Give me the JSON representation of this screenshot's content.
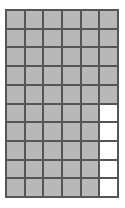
{
  "figure": {
    "name": "area-model-grid",
    "colors": {
      "shaded_fill": "#b8b8b8",
      "unshaded_fill": "#ffffff",
      "grid_line": "#555555",
      "background": "#ffffff"
    }
  },
  "chart_data": {
    "type": "heatmap",
    "title": "",
    "subtitle": "",
    "xlabel": "",
    "ylabel": "",
    "columns": 6,
    "rows": 10,
    "total_cells": 60,
    "shaded_cells": 55,
    "unshaded_cells": 5,
    "fraction_shaded": "55/60",
    "grid": true,
    "legend": "none",
    "column_labels": [
      "1",
      "2",
      "3",
      "4",
      "5",
      "6"
    ],
    "row_labels": [
      "1",
      "2",
      "3",
      "4",
      "5",
      "6",
      "7",
      "8",
      "9",
      "10"
    ],
    "categories": [
      "shaded",
      "unshaded"
    ],
    "values": [
      55,
      5
    ],
    "cells": [
      [
        "shaded",
        "shaded",
        "shaded",
        "shaded",
        "shaded",
        "shaded"
      ],
      [
        "shaded",
        "shaded",
        "shaded",
        "shaded",
        "shaded",
        "shaded"
      ],
      [
        "shaded",
        "shaded",
        "shaded",
        "shaded",
        "shaded",
        "shaded"
      ],
      [
        "shaded",
        "shaded",
        "shaded",
        "shaded",
        "shaded",
        "shaded"
      ],
      [
        "shaded",
        "shaded",
        "shaded",
        "shaded",
        "shaded",
        "shaded"
      ],
      [
        "shaded",
        "shaded",
        "shaded",
        "shaded",
        "shaded",
        "unshaded"
      ],
      [
        "shaded",
        "shaded",
        "shaded",
        "shaded",
        "shaded",
        "unshaded"
      ],
      [
        "shaded",
        "shaded",
        "shaded",
        "shaded",
        "shaded",
        "unshaded"
      ],
      [
        "shaded",
        "shaded",
        "shaded",
        "shaded",
        "shaded",
        "unshaded"
      ],
      [
        "shaded",
        "shaded",
        "shaded",
        "shaded",
        "shaded",
        "unshaded"
      ]
    ]
  }
}
